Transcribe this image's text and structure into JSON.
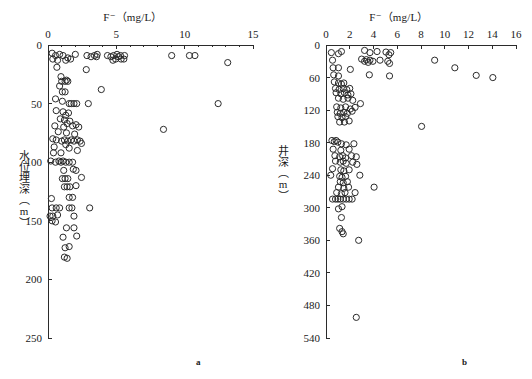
{
  "figure": {
    "panel_a_letter": "a",
    "panel_b_letter": "b"
  },
  "chart_data": [
    {
      "id": "panel_a",
      "type": "scatter",
      "title": "F⁻（mg/L）",
      "xlabel": "F⁻（mg/L）",
      "ylabel": "水位埋深（m）",
      "panel_label": "a",
      "xlim": [
        0,
        15
      ],
      "ylim": [
        0,
        250
      ],
      "y_inverted": true,
      "x_axis_position": "top",
      "grid": false,
      "legend": "none",
      "xticks": [
        0,
        5,
        10,
        15
      ],
      "xtick_labels": [
        "0",
        "5",
        "10",
        "15"
      ],
      "xminor_ticks": [
        1,
        2,
        3,
        4,
        6,
        7,
        8,
        9,
        11,
        12,
        13,
        14
      ],
      "yticks": [
        0,
        50,
        100,
        150,
        200,
        250
      ],
      "ytick_labels": [
        "0",
        "50",
        "100",
        "150",
        "200",
        "250"
      ],
      "marker": "open-circle",
      "marker_color": "#2b2b2b",
      "points": [
        [
          0.3,
          7
        ],
        [
          0.55,
          9
        ],
        [
          0.85,
          8
        ],
        [
          1.1,
          9
        ],
        [
          1.45,
          11
        ],
        [
          0.35,
          12
        ],
        [
          0.7,
          13
        ],
        [
          1.3,
          13
        ],
        [
          1.65,
          12
        ],
        [
          2.0,
          8
        ],
        [
          2.85,
          9
        ],
        [
          3.15,
          10
        ],
        [
          3.4,
          9
        ],
        [
          3.55,
          10
        ],
        [
          3.6,
          8
        ],
        [
          4.35,
          9
        ],
        [
          4.6,
          10
        ],
        [
          4.8,
          9
        ],
        [
          5.05,
          8
        ],
        [
          5.15,
          10
        ],
        [
          5.3,
          9
        ],
        [
          5.55,
          12
        ],
        [
          5.35,
          12
        ],
        [
          4.75,
          13
        ],
        [
          5.6,
          9
        ],
        [
          4.95,
          12
        ],
        [
          9.05,
          9
        ],
        [
          10.35,
          9
        ],
        [
          10.75,
          9
        ],
        [
          13.15,
          15
        ],
        [
          0.65,
          19
        ],
        [
          2.8,
          21
        ],
        [
          0.95,
          27
        ],
        [
          1.0,
          31
        ],
        [
          1.25,
          31
        ],
        [
          1.35,
          30
        ],
        [
          1.45,
          31
        ],
        [
          0.85,
          35
        ],
        [
          1.05,
          40
        ],
        [
          1.25,
          40
        ],
        [
          3.9,
          38
        ],
        [
          0.55,
          46
        ],
        [
          1.05,
          48
        ],
        [
          1.55,
          50
        ],
        [
          1.7,
          50
        ],
        [
          1.9,
          50
        ],
        [
          2.1,
          50
        ],
        [
          2.95,
          50
        ],
        [
          12.45,
          50
        ],
        [
          0.6,
          56
        ],
        [
          1.1,
          57
        ],
        [
          1.3,
          60
        ],
        [
          1.5,
          58
        ],
        [
          0.9,
          63
        ],
        [
          1.2,
          64
        ],
        [
          1.6,
          65
        ],
        [
          1.4,
          67
        ],
        [
          0.5,
          69
        ],
        [
          1.15,
          70
        ],
        [
          1.8,
          69
        ],
        [
          2.05,
          68
        ],
        [
          2.25,
          70
        ],
        [
          0.75,
          74
        ],
        [
          1.35,
          75
        ],
        [
          1.95,
          76
        ],
        [
          8.45,
          72
        ],
        [
          0.35,
          80
        ],
        [
          0.6,
          81
        ],
        [
          1.0,
          82
        ],
        [
          1.2,
          81
        ],
        [
          1.45,
          82
        ],
        [
          1.7,
          81
        ],
        [
          1.9,
          82
        ],
        [
          2.15,
          81
        ],
        [
          2.35,
          82
        ],
        [
          1.3,
          85
        ],
        [
          0.45,
          87
        ],
        [
          1.55,
          88
        ],
        [
          2.45,
          84
        ],
        [
          0.4,
          92
        ],
        [
          0.95,
          92
        ],
        [
          2.15,
          90
        ],
        [
          0.2,
          99
        ],
        [
          0.55,
          100
        ],
        [
          0.8,
          99
        ],
        [
          0.95,
          100
        ],
        [
          1.1,
          99
        ],
        [
          1.3,
          100
        ],
        [
          1.55,
          100
        ],
        [
          1.8,
          100
        ],
        [
          1.15,
          107
        ],
        [
          1.85,
          106
        ],
        [
          2.05,
          107
        ],
        [
          1.05,
          114
        ],
        [
          1.25,
          114
        ],
        [
          1.45,
          114
        ],
        [
          2.45,
          113
        ],
        [
          1.2,
          121
        ],
        [
          1.4,
          121
        ],
        [
          1.6,
          121
        ],
        [
          2.05,
          120
        ],
        [
          0.25,
          131
        ],
        [
          1.55,
          130
        ],
        [
          1.8,
          130
        ],
        [
          0.3,
          139
        ],
        [
          0.6,
          139
        ],
        [
          0.85,
          139
        ],
        [
          1.55,
          139
        ],
        [
          1.75,
          139
        ],
        [
          3.05,
          139
        ],
        [
          0.15,
          146
        ],
        [
          0.35,
          146
        ],
        [
          0.7,
          145
        ],
        [
          1.9,
          146
        ],
        [
          0.3,
          150
        ],
        [
          0.55,
          151
        ],
        [
          1.35,
          156
        ],
        [
          1.9,
          156
        ],
        [
          1.1,
          164
        ],
        [
          2.1,
          163
        ],
        [
          1.25,
          173
        ],
        [
          1.55,
          172
        ],
        [
          1.2,
          181
        ],
        [
          1.4,
          182
        ]
      ]
    },
    {
      "id": "panel_b",
      "type": "scatter",
      "title": "F⁻（mg/L）",
      "xlabel": "F⁻（mg/L）",
      "ylabel": "井深（m）",
      "panel_label": "b",
      "xlim": [
        0,
        16
      ],
      "ylim": [
        0,
        540
      ],
      "y_inverted": true,
      "x_axis_position": "top",
      "grid": false,
      "legend": "none",
      "xticks": [
        0,
        2,
        4,
        6,
        8,
        10,
        12,
        14,
        16
      ],
      "xtick_labels": [
        "0",
        "2",
        "4",
        "6",
        "8",
        "10",
        "12",
        "14",
        "16"
      ],
      "yticks": [
        0,
        60,
        120,
        180,
        240,
        300,
        360,
        420,
        480,
        540
      ],
      "ytick_labels": [
        "0",
        "60",
        "120",
        "180",
        "240",
        "300",
        "360",
        "420",
        "480",
        "540"
      ],
      "marker": "open-circle",
      "marker_color": "#2b2b2b",
      "points": [
        [
          0.45,
          14
        ],
        [
          1.05,
          16
        ],
        [
          1.3,
          12
        ],
        [
          3.25,
          10
        ],
        [
          3.7,
          14
        ],
        [
          4.3,
          12
        ],
        [
          5.05,
          13
        ],
        [
          5.3,
          18
        ],
        [
          5.45,
          14
        ],
        [
          0.55,
          28
        ],
        [
          3.0,
          26
        ],
        [
          3.25,
          30
        ],
        [
          3.4,
          27
        ],
        [
          3.55,
          32
        ],
        [
          3.7,
          28
        ],
        [
          3.95,
          30
        ],
        [
          4.55,
          28
        ],
        [
          5.2,
          30
        ],
        [
          5.35,
          34
        ],
        [
          9.15,
          28
        ],
        [
          0.6,
          42
        ],
        [
          1.05,
          42
        ],
        [
          2.05,
          45
        ],
        [
          10.85,
          42
        ],
        [
          0.65,
          55
        ],
        [
          1.05,
          57
        ],
        [
          3.65,
          55
        ],
        [
          5.35,
          57
        ],
        [
          12.65,
          56
        ],
        [
          14.05,
          60
        ],
        [
          0.7,
          68
        ],
        [
          1.05,
          70
        ],
        [
          1.3,
          72
        ],
        [
          1.5,
          70
        ],
        [
          0.8,
          80
        ],
        [
          1.1,
          82
        ],
        [
          1.45,
          80
        ],
        [
          1.75,
          82
        ],
        [
          2.0,
          80
        ],
        [
          0.85,
          88
        ],
        [
          1.25,
          90
        ],
        [
          1.55,
          88
        ],
        [
          1.85,
          92
        ],
        [
          2.1,
          90
        ],
        [
          1.05,
          98
        ],
        [
          1.45,
          100
        ],
        [
          1.85,
          98
        ],
        [
          2.25,
          102
        ],
        [
          2.9,
          108
        ],
        [
          0.9,
          114
        ],
        [
          1.25,
          116
        ],
        [
          1.65,
          114
        ],
        [
          2.05,
          118
        ],
        [
          2.45,
          115
        ],
        [
          0.95,
          124
        ],
        [
          1.2,
          126
        ],
        [
          1.5,
          124
        ],
        [
          1.8,
          126
        ],
        [
          2.2,
          122
        ],
        [
          1.0,
          132
        ],
        [
          1.35,
          134
        ],
        [
          1.65,
          132
        ],
        [
          1.15,
          142
        ],
        [
          1.55,
          142
        ],
        [
          1.95,
          140
        ],
        [
          8.05,
          150
        ],
        [
          0.5,
          176
        ],
        [
          0.7,
          178
        ],
        [
          0.85,
          176
        ],
        [
          1.0,
          179
        ],
        [
          1.3,
          182
        ],
        [
          1.7,
          184
        ],
        [
          2.35,
          182
        ],
        [
          0.6,
          192
        ],
        [
          1.25,
          194
        ],
        [
          1.95,
          192
        ],
        [
          0.75,
          204
        ],
        [
          1.15,
          206
        ],
        [
          1.4,
          204
        ],
        [
          1.65,
          208
        ],
        [
          2.15,
          204
        ],
        [
          2.55,
          206
        ],
        [
          0.8,
          214
        ],
        [
          1.2,
          216
        ],
        [
          1.45,
          214
        ],
        [
          1.7,
          218
        ],
        [
          2.25,
          216
        ],
        [
          2.6,
          220
        ],
        [
          0.55,
          228
        ],
        [
          1.25,
          230
        ],
        [
          1.5,
          232
        ],
        [
          1.95,
          230
        ],
        [
          0.4,
          240
        ],
        [
          1.15,
          242
        ],
        [
          1.35,
          244
        ],
        [
          1.65,
          242
        ],
        [
          2.85,
          240
        ],
        [
          1.2,
          252
        ],
        [
          1.45,
          254
        ],
        [
          1.8,
          252
        ],
        [
          1.05,
          262
        ],
        [
          1.5,
          264
        ],
        [
          1.9,
          262
        ],
        [
          4.05,
          262
        ],
        [
          0.9,
          272
        ],
        [
          1.3,
          274
        ],
        [
          1.6,
          272
        ],
        [
          2.45,
          272
        ],
        [
          0.55,
          284
        ],
        [
          0.8,
          284
        ],
        [
          1.0,
          284
        ],
        [
          1.2,
          284
        ],
        [
          1.45,
          284
        ],
        [
          1.7,
          284
        ],
        [
          1.95,
          284
        ],
        [
          2.2,
          284
        ],
        [
          1.35,
          298
        ],
        [
          1.05,
          302
        ],
        [
          1.3,
          318
        ],
        [
          1.15,
          338
        ],
        [
          1.35,
          344
        ],
        [
          1.45,
          348
        ],
        [
          2.75,
          360
        ],
        [
          2.55,
          502
        ]
      ]
    }
  ]
}
